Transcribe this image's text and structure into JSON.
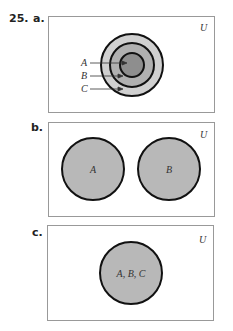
{
  "problem": {
    "number": "25.",
    "parts": [
      "a.",
      "b.",
      "c."
    ]
  },
  "colors": {
    "border": "#999999",
    "circle_stroke": "#111111",
    "fill_light": "#d0d0d0",
    "fill_mid": "#b0b0b0",
    "fill_dark": "#8e8e8e",
    "fill_b": "#b8b8b8"
  },
  "panel_a": {
    "universe": "U",
    "labels": [
      "A",
      "B",
      "C"
    ]
  },
  "panel_b": {
    "universe": "U",
    "circles": [
      "A",
      "B"
    ]
  },
  "panel_c": {
    "universe": "U",
    "circle": "A, B, C"
  }
}
